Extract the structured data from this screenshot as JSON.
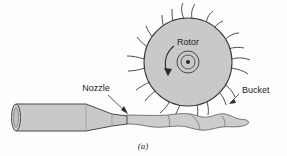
{
  "figure": {
    "kind": "pelton-turbine-schematic",
    "caption": "(a)",
    "labels": {
      "rotor": "Rotor",
      "nozzle": "Nozzle",
      "bucket": "Bucket"
    },
    "colors": {
      "background": "#fdfdfd",
      "part_fill": "#c9c9c9",
      "water_fill": "#cdcdcd",
      "outline": "#3b3b3b",
      "text": "#1b1b1b"
    }
  },
  "geometry": {
    "rotor": {
      "center_x": 188,
      "center_y": 62,
      "radius": 44,
      "hub_outer_radius": 11,
      "hub_inner_radius": 7,
      "hub_dot_radius": 2,
      "bucket_count": 12
    },
    "nozzle": {
      "inlet_x": 12,
      "inlet_y_top": 104,
      "inlet_y_bottom": 131,
      "throat_x": 127,
      "throat_y_top": 116,
      "throat_y_bottom": 124
    },
    "jet": {
      "start_x": 127,
      "end_x": 232,
      "centerline_y": 120
    },
    "rotation_arrow": {
      "direction": "counter-clockwise",
      "label": "rotation-arrow"
    }
  },
  "annotations": {
    "nozzle_leader": {
      "text_x": 96,
      "text_y": 92,
      "tip_x": 127,
      "tip_y": 112
    },
    "bucket_leader": {
      "text_x": 240,
      "text_y": 94,
      "tip_x": 229,
      "tip_y": 103
    },
    "rotor_label": {
      "x": 188,
      "y": 45
    },
    "caption": {
      "x": 143,
      "y": 146
    }
  }
}
